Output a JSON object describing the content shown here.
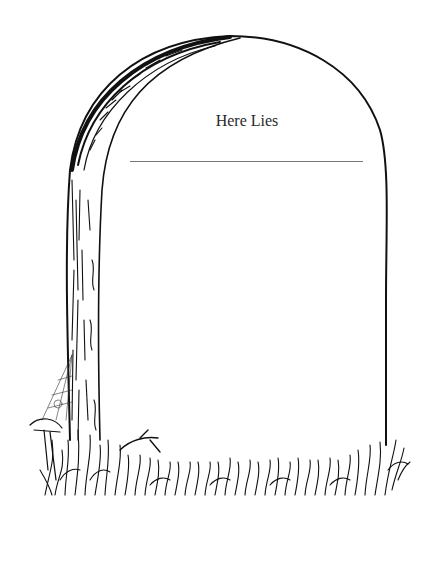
{
  "illustration": {
    "subject": "tombstone-line-drawing",
    "inscription": "Here Lies",
    "name_line": "",
    "colors": {
      "ink": "#111111",
      "background": "#ffffff",
      "rule": "#777777"
    }
  }
}
